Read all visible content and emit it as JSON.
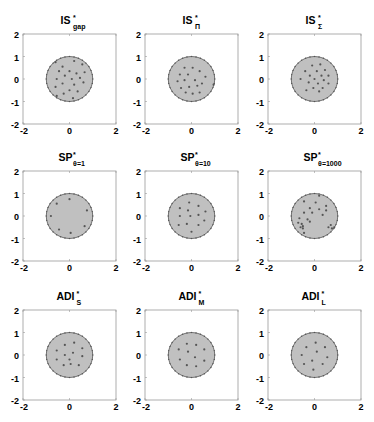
{
  "figure": {
    "colors": {
      "disk_fill": "#c0c0c0",
      "disk_edge": "#555555",
      "point": "#555555",
      "axes": "#999999",
      "background": "#ffffff"
    }
  },
  "chart_data": [
    {
      "type": "scatter",
      "panel": "IS_gap",
      "title": "IS",
      "title_sup": "*",
      "title_sub": "gap",
      "xlim": [
        -2,
        2
      ],
      "ylim": [
        -2,
        2
      ],
      "xticks": [
        "-2",
        "0",
        "2"
      ],
      "yticks": [
        "-2",
        "-1",
        "0",
        "1",
        "2"
      ],
      "region": {
        "shape": "unit-disk",
        "radius": 1
      },
      "points": [
        [
          -0.6,
          0.75
        ],
        [
          -0.3,
          0.55
        ],
        [
          0.2,
          0.8
        ],
        [
          0.55,
          0.65
        ],
        [
          -0.45,
          0.35
        ],
        [
          0.0,
          0.35
        ],
        [
          0.3,
          0.25
        ],
        [
          0.65,
          0.3
        ],
        [
          -0.2,
          0.15
        ],
        [
          -0.55,
          0.0
        ],
        [
          0.1,
          0.0
        ],
        [
          0.45,
          0.05
        ],
        [
          -0.3,
          -0.2
        ],
        [
          0.2,
          -0.25
        ],
        [
          0.6,
          -0.15
        ],
        [
          -0.6,
          -0.35
        ],
        [
          0.0,
          -0.5
        ],
        [
          0.35,
          -0.55
        ],
        [
          -0.25,
          -0.65
        ],
        [
          -0.55,
          -0.75
        ],
        [
          0.15,
          -0.85
        ]
      ]
    },
    {
      "type": "scatter",
      "panel": "IS_Pi",
      "title": "IS",
      "title_sup": "*",
      "title_sub": "Π",
      "xlim": [
        -2,
        2
      ],
      "ylim": [
        -2,
        2
      ],
      "xticks": [
        "-2",
        "0",
        "2"
      ],
      "yticks": [
        "-2",
        "-1",
        "0",
        "1",
        "2"
      ],
      "region": {
        "shape": "unit-disk",
        "radius": 1
      },
      "points": [
        [
          -0.3,
          0.5
        ],
        [
          0.05,
          0.5
        ],
        [
          0.35,
          0.35
        ],
        [
          -0.5,
          0.2
        ],
        [
          -0.15,
          0.2
        ],
        [
          0.6,
          0.1
        ],
        [
          -0.6,
          -0.1
        ],
        [
          -0.3,
          -0.05
        ],
        [
          0.15,
          -0.05
        ],
        [
          0.45,
          -0.2
        ],
        [
          -0.45,
          -0.4
        ],
        [
          -0.1,
          -0.35
        ],
        [
          0.25,
          -0.3
        ],
        [
          -0.25,
          -0.6
        ],
        [
          0.05,
          -0.65
        ],
        [
          0.35,
          -0.6
        ],
        [
          0.95,
          -0.25
        ]
      ]
    },
    {
      "type": "scatter",
      "panel": "IS_Sigma",
      "title": "IS",
      "title_sup": "*",
      "title_sub": "Σ",
      "xlim": [
        -2,
        2
      ],
      "ylim": [
        -2,
        2
      ],
      "xticks": [
        "-2",
        "0",
        "2"
      ],
      "yticks": [
        "-2",
        "-1",
        "0",
        "1",
        "2"
      ],
      "region": {
        "shape": "unit-disk",
        "radius": 1
      },
      "points": [
        [
          -0.1,
          0.6
        ],
        [
          0.25,
          0.65
        ],
        [
          -0.4,
          0.35
        ],
        [
          0.1,
          0.35
        ],
        [
          0.45,
          0.4
        ],
        [
          -0.2,
          0.15
        ],
        [
          0.3,
          0.15
        ],
        [
          0.6,
          0.15
        ],
        [
          -0.6,
          0.0
        ],
        [
          0.0,
          0.0
        ],
        [
          0.4,
          -0.05
        ],
        [
          -0.25,
          -0.15
        ],
        [
          0.15,
          -0.2
        ],
        [
          0.6,
          -0.2
        ],
        [
          -0.05,
          -0.4
        ],
        [
          0.35,
          -0.4
        ],
        [
          -0.35,
          -0.5
        ],
        [
          0.2,
          -0.55
        ]
      ]
    },
    {
      "type": "scatter",
      "panel": "SP_theta1",
      "title": "SP",
      "title_sup": "*",
      "title_sub": "θ=1",
      "xlim": [
        -2,
        2
      ],
      "ylim": [
        -2,
        2
      ],
      "xticks": [
        "-2",
        "0",
        "2"
      ],
      "yticks": [
        "-2",
        "-1",
        "0",
        "1",
        "2"
      ],
      "region": {
        "shape": "unit-disk",
        "radius": 1
      },
      "points": [
        [
          -0.55,
          0.55
        ],
        [
          0.0,
          0.75
        ],
        [
          0.75,
          0.25
        ],
        [
          -0.8,
          0.0
        ],
        [
          0.65,
          -0.45
        ],
        [
          -0.45,
          -0.6
        ],
        [
          0.05,
          -0.75
        ]
      ]
    },
    {
      "type": "scatter",
      "panel": "SP_theta10",
      "title": "SP",
      "title_sup": "*",
      "title_sub": "θ=10",
      "xlim": [
        -2,
        2
      ],
      "ylim": [
        -2,
        2
      ],
      "xticks": [
        "-2",
        "0",
        "2"
      ],
      "yticks": [
        "-2",
        "-1",
        "0",
        "1",
        "2"
      ],
      "region": {
        "shape": "unit-disk",
        "radius": 1
      },
      "points": [
        [
          -0.1,
          0.6
        ],
        [
          0.3,
          0.45
        ],
        [
          -0.5,
          0.35
        ],
        [
          -0.15,
          0.25
        ],
        [
          0.6,
          0.2
        ],
        [
          0.3,
          0.05
        ],
        [
          -0.5,
          0.0
        ],
        [
          -0.05,
          0.0
        ],
        [
          0.55,
          -0.2
        ],
        [
          -0.55,
          -0.4
        ],
        [
          -0.2,
          -0.35
        ],
        [
          0.3,
          -0.4
        ],
        [
          0.0,
          -0.7
        ]
      ]
    },
    {
      "type": "scatter",
      "panel": "SP_theta1000",
      "title": "SP",
      "title_sup": "*",
      "title_sub": "θ=1000",
      "xlim": [
        -2,
        2
      ],
      "ylim": [
        -2,
        2
      ],
      "xticks": [
        "-2",
        "0",
        "2"
      ],
      "yticks": [
        "-2",
        "-1",
        "0",
        "1",
        "2"
      ],
      "region": {
        "shape": "unit-disk",
        "radius": 1
      },
      "points": [
        [
          0.2,
          0.9
        ],
        [
          -0.45,
          0.65
        ],
        [
          0.05,
          0.6
        ],
        [
          0.5,
          0.45
        ],
        [
          -0.2,
          0.35
        ],
        [
          0.2,
          0.3
        ],
        [
          0.5,
          0.25
        ],
        [
          -0.45,
          0.15
        ],
        [
          -0.1,
          0.15
        ],
        [
          0.35,
          0.05
        ],
        [
          -0.65,
          -0.1
        ],
        [
          -0.3,
          -0.15
        ],
        [
          -0.2,
          -0.25
        ],
        [
          -0.55,
          -0.35
        ],
        [
          -0.5,
          -0.45
        ],
        [
          -0.6,
          -0.5
        ],
        [
          -0.5,
          -0.55
        ],
        [
          0.7,
          -0.4
        ],
        [
          0.85,
          -0.5
        ],
        [
          0.75,
          -0.55
        ],
        [
          0.6,
          -0.5
        ],
        [
          -0.45,
          -0.75
        ],
        [
          -0.7,
          -0.3
        ]
      ]
    },
    {
      "type": "scatter",
      "panel": "ADI_S",
      "title": "ADI",
      "title_sup": "*",
      "title_sub": "S",
      "xlim": [
        -2,
        2
      ],
      "ylim": [
        -2,
        2
      ],
      "xticks": [
        "-2",
        "0",
        "2"
      ],
      "yticks": [
        "-2",
        "-1",
        "0",
        "1",
        "2"
      ],
      "region": {
        "shape": "unit-disk",
        "radius": 1
      },
      "points": [
        [
          -0.2,
          0.45
        ],
        [
          0.2,
          0.55
        ],
        [
          0.55,
          0.3
        ],
        [
          -0.55,
          0.2
        ],
        [
          0.15,
          0.1
        ],
        [
          -0.2,
          0.0
        ],
        [
          0.55,
          -0.05
        ],
        [
          -0.55,
          -0.2
        ],
        [
          -0.25,
          -0.45
        ],
        [
          0.05,
          -0.4
        ],
        [
          0.4,
          -0.45
        ],
        [
          0.0,
          -0.2
        ]
      ]
    },
    {
      "type": "scatter",
      "panel": "ADI_M",
      "title": "ADI",
      "title_sup": "*",
      "title_sub": "M",
      "xlim": [
        -2,
        2
      ],
      "ylim": [
        -2,
        2
      ],
      "xticks": [
        "-2",
        "0",
        "2"
      ],
      "yticks": [
        "-2",
        "-1",
        "0",
        "1",
        "2"
      ],
      "region": {
        "shape": "unit-disk",
        "radius": 1
      },
      "points": [
        [
          -0.2,
          0.5
        ],
        [
          0.2,
          0.45
        ],
        [
          -0.55,
          0.25
        ],
        [
          0.55,
          0.25
        ],
        [
          -0.15,
          0.15
        ],
        [
          0.15,
          -0.1
        ],
        [
          -0.5,
          -0.2
        ],
        [
          0.55,
          -0.25
        ],
        [
          -0.2,
          -0.45
        ],
        [
          0.2,
          -0.5
        ]
      ]
    },
    {
      "type": "scatter",
      "panel": "ADI_L",
      "title": "ADI",
      "title_sup": "*",
      "title_sub": "L",
      "xlim": [
        -2,
        2
      ],
      "ylim": [
        -2,
        2
      ],
      "xticks": [
        "-2",
        "0",
        "2"
      ],
      "yticks": [
        "-2",
        "-1",
        "0",
        "1",
        "2"
      ],
      "region": {
        "shape": "unit-disk",
        "radius": 1
      },
      "points": [
        [
          0.05,
          0.55
        ],
        [
          -0.35,
          0.35
        ],
        [
          0.45,
          0.35
        ],
        [
          0.1,
          0.15
        ],
        [
          -0.55,
          0.0
        ],
        [
          0.55,
          -0.1
        ],
        [
          -0.1,
          -0.25
        ],
        [
          -0.45,
          -0.4
        ],
        [
          0.35,
          -0.4
        ],
        [
          -0.05,
          -0.65
        ]
      ]
    }
  ]
}
